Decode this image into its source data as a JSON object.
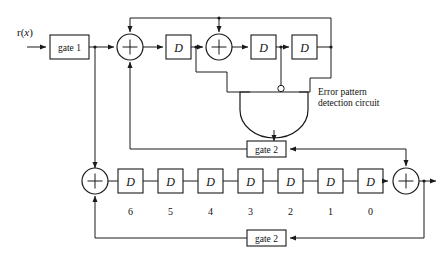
{
  "figure": {
    "type": "block-diagram",
    "input_signal": {
      "prefix": "r(",
      "variable": "x",
      "suffix": ")",
      "full": "r(x)"
    },
    "gates": {
      "gate1_label": "gate 1",
      "gate2_mid_label": "gate 2",
      "gate2_bottom_label": "gate 2"
    },
    "detector": {
      "line1": "Error pattern",
      "line2": "detection circuit",
      "gate_type": "and-gate",
      "inverted_input_index": 1,
      "input_count": 3
    },
    "syndrome_register": {
      "stage_label": "D",
      "stage_count": 3,
      "adder_symbol": "+",
      "adder_count": 2
    },
    "buffer_register": {
      "stage_label": "D",
      "stage_count": 7,
      "stage_numbers": [
        "6",
        "5",
        "4",
        "3",
        "2",
        "1",
        "0"
      ],
      "adder_symbol": "+",
      "left_adder_symbol": "+",
      "right_adder_symbol": "+"
    },
    "colors": {
      "line": "#1a1a1a",
      "background": "#ffffff",
      "text": "#111111"
    }
  }
}
